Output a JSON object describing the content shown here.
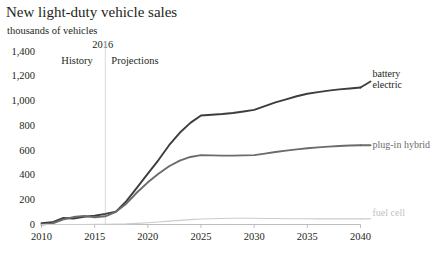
{
  "chart_data": {
    "type": "line",
    "title": "New light-duty vehicle sales",
    "subtitle": "thousands of vehicles",
    "xlabel": "",
    "ylabel": "thousands of vehicles",
    "xlim": [
      2010,
      2040
    ],
    "ylim": [
      0,
      1400
    ],
    "yticks": [
      0,
      200,
      400,
      600,
      800,
      1000,
      1200,
      1400
    ],
    "ytick_labels": [
      "0",
      "200",
      "400",
      "600",
      "800",
      "1,000",
      "1,200",
      "1,400"
    ],
    "xticks": [
      2010,
      2015,
      2020,
      2025,
      2030,
      2035,
      2040
    ],
    "xtick_labels": [
      "2010",
      "2015",
      "2020",
      "2025",
      "2030",
      "2035",
      "2040"
    ],
    "grid": false,
    "legend_position": "inline-right",
    "annotations": {
      "divider_year": "2016",
      "divider_x": 2016,
      "history_label": "History",
      "projections_label": "Projections"
    },
    "x": [
      2010,
      2011,
      2012,
      2013,
      2014,
      2015,
      2016,
      2017,
      2018,
      2019,
      2020,
      2021,
      2022,
      2023,
      2024,
      2025,
      2026,
      2027,
      2028,
      2029,
      2030,
      2031,
      2032,
      2033,
      2034,
      2035,
      2036,
      2037,
      2038,
      2039,
      2040
    ],
    "series": [
      {
        "name": "battery electric",
        "color": "#3d3d3d",
        "values": [
          10,
          18,
          52,
          48,
          63,
          71,
          86,
          104,
          190,
          300,
          410,
          520,
          640,
          740,
          820,
          880,
          886,
          892,
          900,
          912,
          925,
          955,
          985,
          1010,
          1035,
          1055,
          1068,
          1080,
          1090,
          1098,
          1105
        ]
      },
      {
        "name": "plug-in hybrid",
        "color": "#6b6b6b",
        "values": [
          0,
          8,
          40,
          60,
          70,
          58,
          66,
          102,
          170,
          260,
          340,
          410,
          470,
          515,
          545,
          560,
          558,
          556,
          556,
          558,
          560,
          572,
          585,
          596,
          606,
          615,
          622,
          628,
          633,
          637,
          640
        ]
      },
      {
        "name": "fuel cell",
        "color": "#cccccc",
        "values": [
          0,
          0,
          0,
          0,
          0,
          1,
          2,
          3,
          5,
          9,
          14,
          20,
          27,
          33,
          39,
          44,
          47,
          49,
          50,
          50,
          50,
          49,
          48,
          47,
          46,
          46,
          45,
          45,
          45,
          45,
          45
        ]
      }
    ]
  }
}
